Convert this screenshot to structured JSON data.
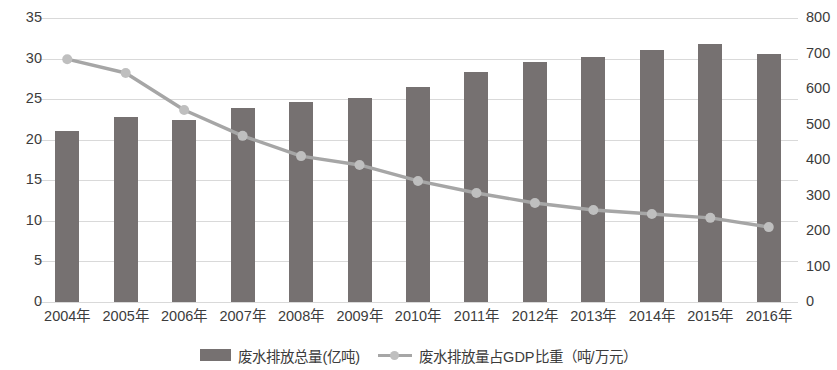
{
  "chart_data": {
    "type": "bar",
    "title": "",
    "subtitle": "",
    "xlabel": "",
    "ylabel": "",
    "grid": true,
    "legend_position": "bottom",
    "categories": [
      "2004年",
      "2005年",
      "2006年",
      "2007年",
      "2008年",
      "2009年",
      "2010年",
      "2011年",
      "2012年",
      "2013年",
      "2014年",
      "2015年",
      "2016年"
    ],
    "axes": {
      "left": {
        "ylim": [
          0,
          35
        ],
        "tick_step": 5,
        "ticks": [
          "0",
          "5",
          "10",
          "15",
          "20",
          "25",
          "30",
          "35"
        ]
      },
      "right": {
        "ylim": [
          0,
          800
        ],
        "tick_step": 100,
        "ticks": [
          "0",
          "100",
          "200",
          "300",
          "400",
          "500",
          "600",
          "700",
          "800"
        ]
      }
    },
    "series": [
      {
        "name": "废水排放总量(亿吨)",
        "type": "bar",
        "axis": "left",
        "color": "#767171",
        "values": [
          21.1,
          22.8,
          22.4,
          23.9,
          24.6,
          25.2,
          26.5,
          28.3,
          29.6,
          30.2,
          31.1,
          31.8,
          30.6
        ]
      },
      {
        "name": "废水排放量占GDP比重（吨/万元）",
        "type": "line",
        "axis": "right",
        "color": "#a6a6a6",
        "marker_color": "#bfbfbf",
        "values": [
          684,
          645,
          541,
          468,
          411,
          386,
          341,
          307,
          279,
          259,
          248,
          237,
          211
        ]
      }
    ]
  },
  "legend": {
    "items": [
      {
        "label": "废水排放总量(亿吨)",
        "swatch": "bar-swatch"
      },
      {
        "label": "废水排放量占GDP比重（吨/万元）",
        "swatch": "line-swatch"
      }
    ]
  }
}
